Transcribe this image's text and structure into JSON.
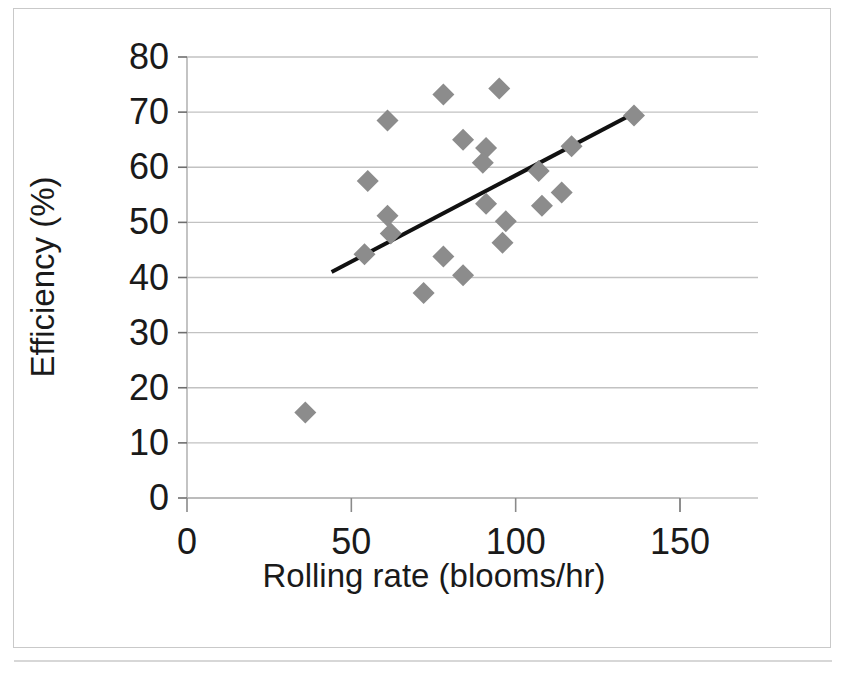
{
  "chart_data": {
    "type": "scatter",
    "title": "",
    "xlabel": "Rolling rate (blooms/hr)",
    "ylabel": "Efficiency (%)",
    "xlim": [
      0,
      150
    ],
    "ylim": [
      0,
      80
    ],
    "xticks": [
      0,
      50,
      100,
      150
    ],
    "yticks": [
      0,
      10,
      20,
      30,
      40,
      50,
      60,
      70,
      80
    ],
    "xtick_labels": [
      "0",
      "50",
      "100",
      "150"
    ],
    "ytick_labels": [
      "0",
      "10",
      "20",
      "30",
      "40",
      "50",
      "60",
      "70",
      "80"
    ],
    "grid": "horizontal",
    "legend": "none",
    "marker": {
      "shape": "diamond",
      "color": "#8c8c8c",
      "size_px": 22
    },
    "series": [
      {
        "name": "Efficiency vs rolling rate",
        "points": [
          [
            36,
            15.5
          ],
          [
            54,
            44.2
          ],
          [
            55,
            57.5
          ],
          [
            61,
            68.5
          ],
          [
            61,
            51.2
          ],
          [
            62,
            48.0
          ],
          [
            72,
            37.2
          ],
          [
            78,
            73.2
          ],
          [
            78,
            43.8
          ],
          [
            84,
            65.0
          ],
          [
            84,
            40.4
          ],
          [
            91,
            63.5
          ],
          [
            90,
            60.8
          ],
          [
            91,
            53.4
          ],
          [
            95,
            74.3
          ],
          [
            97,
            50.2
          ],
          [
            96,
            46.3
          ],
          [
            107,
            59.3
          ],
          [
            108,
            53.0
          ],
          [
            114,
            55.4
          ],
          [
            117,
            63.8
          ],
          [
            136,
            69.4
          ]
        ]
      }
    ],
    "trendline": {
      "type": "linear",
      "color": "#111111",
      "width_px": 4,
      "x_start": 44,
      "y_start": 41.0,
      "x_end": 136,
      "y_end": 69.8
    }
  },
  "axes": {
    "x_title": "Rolling rate (blooms/hr)",
    "y_title": "Efficiency (%)"
  }
}
